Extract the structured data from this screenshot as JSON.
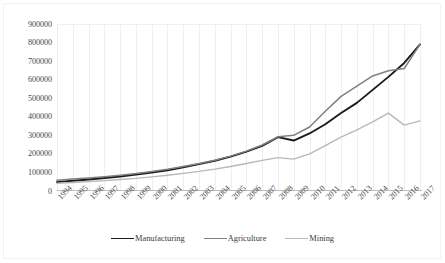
{
  "chart_data": {
    "type": "line",
    "title": "",
    "subtitle": "",
    "xlabel": "",
    "ylabel": "",
    "grid": true,
    "legend_position": "bottom",
    "ylim": [
      0,
      900000
    ],
    "ytick_values": [
      900000,
      800000,
      700000,
      600000,
      500000,
      400000,
      300000,
      200000,
      100000,
      0
    ],
    "ytick_labels": [
      "900000",
      "800000",
      "700000",
      "600000",
      "500000",
      "400000",
      "300000",
      "200000",
      "100000",
      "0"
    ],
    "categories": [
      "1994",
      "1995",
      "1996",
      "1997",
      "1998",
      "1999",
      "2000",
      "2001",
      "2002",
      "2003",
      "2004",
      "2005",
      "2006",
      "2007",
      "2008",
      "2009",
      "2010",
      "2011",
      "2012",
      "2013",
      "2014",
      "2015",
      "2016",
      "2017"
    ],
    "series": [
      {
        "name": "Manufacturing",
        "color": "#1a1a1a",
        "values": [
          48000,
          55000,
          62000,
          70000,
          78000,
          88000,
          100000,
          112000,
          128000,
          145000,
          163000,
          185000,
          212000,
          243000,
          290000,
          272000,
          310000,
          360000,
          420000,
          475000,
          545000,
          615000,
          690000,
          790000
        ]
      },
      {
        "name": "Agriculture",
        "color": "#808080",
        "values": [
          58000,
          64000,
          70000,
          77000,
          85000,
          94000,
          105000,
          117000,
          132000,
          148000,
          166000,
          188000,
          215000,
          248000,
          292000,
          300000,
          345000,
          430000,
          510000,
          565000,
          620000,
          648000,
          660000,
          790000
        ]
      },
      {
        "name": "Mining",
        "color": "#b8b8b8",
        "values": [
          42000,
          46000,
          51000,
          56000,
          62000,
          68000,
          76000,
          85000,
          95000,
          106000,
          118000,
          132000,
          148000,
          165000,
          180000,
          172000,
          200000,
          245000,
          290000,
          330000,
          372000,
          420000,
          355000,
          378000
        ]
      }
    ]
  },
  "legend": {
    "items": [
      {
        "label": "Manufacturing",
        "color": "#1a1a1a"
      },
      {
        "label": "Agriculture",
        "color": "#808080"
      },
      {
        "label": "Mining",
        "color": "#b8b8b8"
      }
    ]
  }
}
